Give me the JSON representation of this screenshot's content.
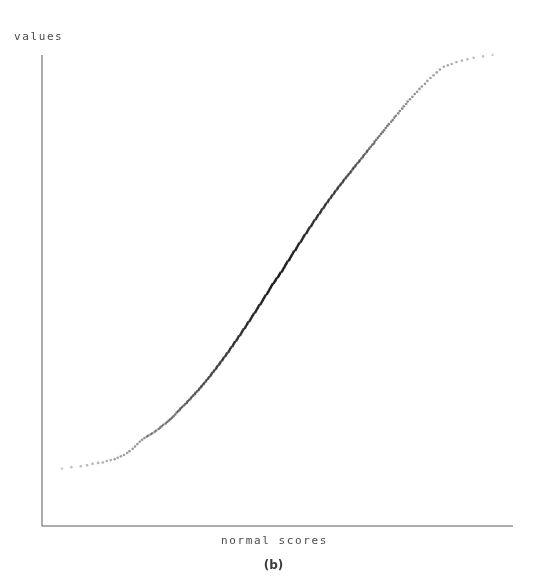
{
  "figure": {
    "caption": "(b)",
    "background_color": "#ffffff"
  },
  "chart_data": {
    "type": "scatter",
    "title": "",
    "subtitle": "",
    "xlabel": "normal scores",
    "ylabel": "values",
    "legend": [],
    "legend_position": "none",
    "grid": false,
    "x_ticks": [],
    "y_ticks": [],
    "x_tick_labels": [],
    "y_tick_labels": [],
    "xlim": [
      -3.0,
      3.0
    ],
    "ylim": [
      0.0,
      1.0
    ],
    "axis_color": "#5a5a5a",
    "axis_line_width": 1,
    "marker": {
      "shape": "dot",
      "size": 1.3,
      "color": "#2b2b2b",
      "name": "data-point"
    },
    "annotations": [],
    "n_points": 252,
    "series": [
      {
        "name": "values vs normal scores",
        "x": [
          -2.74,
          -2.62,
          -2.5,
          -2.42,
          -2.35,
          -2.28,
          -2.22,
          -2.17,
          -2.12,
          -2.07,
          -2.03,
          -1.99,
          -1.95,
          -1.91,
          -1.88,
          -1.84,
          -1.81,
          -1.78,
          -1.75,
          -1.72,
          -1.69,
          -1.66,
          -1.64,
          -1.61,
          -1.59,
          -1.56,
          -1.54,
          -1.51,
          -1.49,
          -1.47,
          -1.45,
          -1.42,
          -1.4,
          -1.38,
          -1.36,
          -1.34,
          -1.32,
          -1.3,
          -1.28,
          -1.26,
          -1.24,
          -1.23,
          -1.21,
          -1.19,
          -1.17,
          -1.15,
          -1.14,
          -1.12,
          -1.1,
          -1.09,
          -1.07,
          -1.05,
          -1.04,
          -1.02,
          -1.0,
          -0.99,
          -0.97,
          -0.96,
          -0.94,
          -0.93,
          -0.91,
          -0.9,
          -0.88,
          -0.87,
          -0.85,
          -0.84,
          -0.83,
          -0.81,
          -0.8,
          -0.78,
          -0.77,
          -0.76,
          -0.74,
          -0.73,
          -0.72,
          -0.7,
          -0.69,
          -0.68,
          -0.66,
          -0.65,
          -0.64,
          -0.62,
          -0.61,
          -0.6,
          -0.59,
          -0.57,
          -0.56,
          -0.55,
          -0.54,
          -0.52,
          -0.51,
          -0.5,
          -0.49,
          -0.47,
          -0.46,
          -0.45,
          -0.44,
          -0.43,
          -0.41,
          -0.4,
          -0.39,
          -0.38,
          -0.37,
          -0.35,
          -0.34,
          -0.33,
          -0.32,
          -0.31,
          -0.3,
          -0.28,
          -0.27,
          -0.26,
          -0.25,
          -0.24,
          -0.23,
          -0.21,
          -0.2,
          -0.19,
          -0.18,
          -0.17,
          -0.16,
          -0.15,
          -0.13,
          -0.12,
          -0.11,
          -0.1,
          -0.09,
          -0.08,
          -0.07,
          -0.06,
          -0.04,
          -0.03,
          -0.02,
          -0.01,
          0.01,
          0.02,
          0.03,
          0.04,
          0.06,
          0.07,
          0.08,
          0.09,
          0.1,
          0.11,
          0.12,
          0.13,
          0.15,
          0.16,
          0.17,
          0.18,
          0.19,
          0.2,
          0.21,
          0.23,
          0.24,
          0.25,
          0.26,
          0.27,
          0.28,
          0.3,
          0.31,
          0.32,
          0.33,
          0.34,
          0.35,
          0.37,
          0.38,
          0.39,
          0.4,
          0.41,
          0.43,
          0.44,
          0.45,
          0.46,
          0.47,
          0.49,
          0.5,
          0.51,
          0.52,
          0.54,
          0.55,
          0.56,
          0.57,
          0.59,
          0.6,
          0.61,
          0.62,
          0.64,
          0.65,
          0.66,
          0.68,
          0.69,
          0.7,
          0.72,
          0.73,
          0.74,
          0.76,
          0.77,
          0.78,
          0.8,
          0.81,
          0.83,
          0.84,
          0.85,
          0.87,
          0.88,
          0.9,
          0.91,
          0.93,
          0.94,
          0.96,
          0.97,
          0.99,
          1.0,
          1.02,
          1.04,
          1.05,
          1.07,
          1.09,
          1.1,
          1.12,
          1.14,
          1.15,
          1.17,
          1.19,
          1.21,
          1.23,
          1.24,
          1.26,
          1.28,
          1.3,
          1.32,
          1.34,
          1.36,
          1.38,
          1.4,
          1.42,
          1.45,
          1.47,
          1.49,
          1.51,
          1.54,
          1.56,
          1.59,
          1.61,
          1.64,
          1.66,
          1.69,
          1.72,
          1.75,
          1.78,
          1.81,
          1.84,
          1.88,
          1.91,
          1.95,
          1.99,
          2.03,
          2.07,
          2.12,
          2.17,
          2.22,
          2.28,
          2.35,
          2.42,
          2.5,
          2.62,
          2.74
        ],
        "y": [
          0.121,
          0.124,
          0.126,
          0.128,
          0.131,
          0.133,
          0.134,
          0.137,
          0.139,
          0.141,
          0.144,
          0.147,
          0.15,
          0.154,
          0.158,
          0.163,
          0.168,
          0.173,
          0.178,
          0.182,
          0.186,
          0.189,
          0.191,
          0.194,
          0.196,
          0.199,
          0.202,
          0.205,
          0.208,
          0.211,
          0.214,
          0.217,
          0.22,
          0.223,
          0.226,
          0.229,
          0.232,
          0.236,
          0.24,
          0.243,
          0.246,
          0.249,
          0.252,
          0.255,
          0.258,
          0.261,
          0.264,
          0.267,
          0.27,
          0.273,
          0.276,
          0.279,
          0.282,
          0.285,
          0.288,
          0.291,
          0.294,
          0.297,
          0.3,
          0.303,
          0.306,
          0.309,
          0.312,
          0.315,
          0.318,
          0.321,
          0.324,
          0.327,
          0.33,
          0.333,
          0.336,
          0.339,
          0.342,
          0.345,
          0.348,
          0.351,
          0.354,
          0.357,
          0.36,
          0.363,
          0.366,
          0.369,
          0.372,
          0.375,
          0.378,
          0.381,
          0.384,
          0.387,
          0.39,
          0.393,
          0.396,
          0.399,
          0.402,
          0.405,
          0.408,
          0.411,
          0.414,
          0.417,
          0.42,
          0.423,
          0.426,
          0.429,
          0.432,
          0.435,
          0.438,
          0.441,
          0.444,
          0.447,
          0.45,
          0.453,
          0.456,
          0.459,
          0.462,
          0.465,
          0.468,
          0.471,
          0.474,
          0.477,
          0.48,
          0.483,
          0.486,
          0.489,
          0.492,
          0.495,
          0.498,
          0.501,
          0.504,
          0.507,
          0.51,
          0.513,
          0.516,
          0.519,
          0.522,
          0.525,
          0.528,
          0.531,
          0.534,
          0.537,
          0.54,
          0.543,
          0.546,
          0.549,
          0.552,
          0.555,
          0.558,
          0.561,
          0.564,
          0.567,
          0.57,
          0.573,
          0.576,
          0.579,
          0.582,
          0.585,
          0.588,
          0.591,
          0.594,
          0.597,
          0.6,
          0.603,
          0.606,
          0.609,
          0.612,
          0.615,
          0.618,
          0.621,
          0.624,
          0.627,
          0.63,
          0.633,
          0.636,
          0.639,
          0.642,
          0.645,
          0.648,
          0.651,
          0.654,
          0.657,
          0.66,
          0.663,
          0.666,
          0.669,
          0.672,
          0.675,
          0.678,
          0.681,
          0.684,
          0.687,
          0.69,
          0.693,
          0.696,
          0.699,
          0.702,
          0.705,
          0.708,
          0.711,
          0.714,
          0.717,
          0.72,
          0.723,
          0.726,
          0.729,
          0.732,
          0.735,
          0.738,
          0.741,
          0.744,
          0.747,
          0.75,
          0.753,
          0.757,
          0.76,
          0.763,
          0.766,
          0.77,
          0.773,
          0.776,
          0.78,
          0.783,
          0.787,
          0.79,
          0.794,
          0.797,
          0.801,
          0.805,
          0.809,
          0.812,
          0.816,
          0.82,
          0.824,
          0.828,
          0.832,
          0.836,
          0.84,
          0.845,
          0.849,
          0.853,
          0.858,
          0.862,
          0.867,
          0.871,
          0.876,
          0.881,
          0.886,
          0.891,
          0.896,
          0.901,
          0.906,
          0.911,
          0.917,
          0.922,
          0.928,
          0.933,
          0.939,
          0.945,
          0.951,
          0.957,
          0.963,
          0.969,
          0.975,
          0.978,
          0.981,
          0.985,
          0.988,
          0.991,
          0.994,
          0.997,
          1.0
        ]
      }
    ]
  }
}
